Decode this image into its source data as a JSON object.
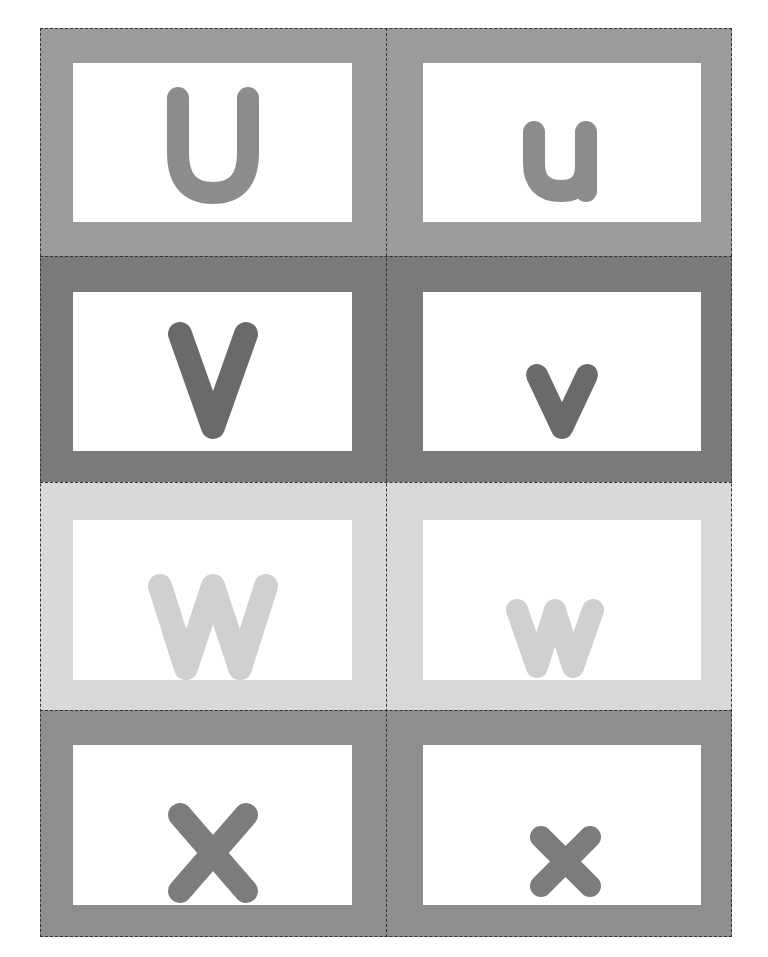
{
  "sheet": {
    "title": "Alphabet Flash Cards U-X",
    "rows": [
      {
        "color": "#9b9b9b",
        "upper": "U",
        "lower": "u"
      },
      {
        "color": "#7a7a7a",
        "upper": "V",
        "lower": "v"
      },
      {
        "color": "#d9d9d9",
        "upper": "W",
        "lower": "w"
      },
      {
        "color": "#8e8e8e",
        "upper": "X",
        "lower": "x"
      }
    ],
    "letter_colors": [
      "#8c8c8c",
      "#6a6a6a",
      "#d0d0d0",
      "#7c7c7c"
    ]
  }
}
